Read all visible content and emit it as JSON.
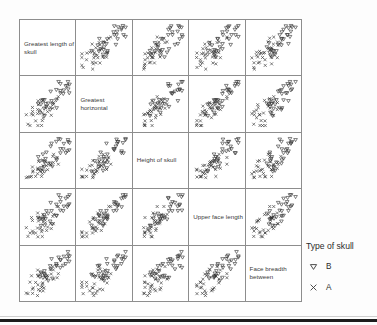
{
  "figure": {
    "title": "",
    "kind": "scatterplot-matrix"
  },
  "legend": {
    "title": "Type of skull",
    "entries": [
      {
        "label": "B",
        "marker": "triangle-down-icon",
        "color": "#2b2b2b"
      },
      {
        "label": "A",
        "marker": "cross-x-icon",
        "color": "#2b2b2b"
      }
    ]
  },
  "chart_data": {
    "type": "scatter",
    "layout": "matrix",
    "matrix_size": 5,
    "title": "",
    "xlabel": "",
    "ylabel": "",
    "grid": false,
    "axis_ticks": false,
    "legend_position": "right",
    "legend_title": "Type of skull",
    "variables": [
      "Greatest length of skull",
      "Greatest horizontal",
      "Height of skull",
      "Upper face length",
      "Face breadth between"
    ],
    "diagonal_labels": [
      "Greatest length of\nskull",
      "Greatest horizontal",
      "Height of skull",
      "Upper face length",
      "Face breadth\nbetween"
    ],
    "series": [
      {
        "name": "B",
        "marker": "triangle-down",
        "color": "#2b2b2b",
        "count": 30
      },
      {
        "name": "A",
        "marker": "cross",
        "color": "#2b2b2b",
        "count": 30
      }
    ],
    "xlim": [
      0,
      1
    ],
    "ylim": [
      0,
      1
    ],
    "points": {
      "B": [
        [
          0.62,
          0.82
        ],
        [
          0.7,
          0.78
        ],
        [
          0.58,
          0.9
        ],
        [
          0.66,
          0.7
        ],
        [
          0.74,
          0.64
        ],
        [
          0.54,
          0.74
        ],
        [
          0.6,
          0.62
        ],
        [
          0.68,
          0.86
        ],
        [
          0.5,
          0.66
        ],
        [
          0.72,
          0.72
        ],
        [
          0.64,
          0.58
        ],
        [
          0.56,
          0.56
        ],
        [
          0.78,
          0.8
        ],
        [
          0.46,
          0.6
        ],
        [
          0.66,
          0.5
        ],
        [
          0.6,
          0.46
        ],
        [
          0.74,
          0.88
        ],
        [
          0.52,
          0.84
        ],
        [
          0.7,
          0.54
        ],
        [
          0.58,
          0.68
        ],
        [
          0.82,
          0.74
        ],
        [
          0.48,
          0.78
        ],
        [
          0.64,
          0.92
        ],
        [
          0.76,
          0.58
        ],
        [
          0.54,
          0.5
        ],
        [
          0.68,
          0.66
        ],
        [
          0.44,
          0.7
        ],
        [
          0.8,
          0.66
        ],
        [
          0.62,
          0.36
        ],
        [
          0.72,
          0.44
        ]
      ],
      "A": [
        [
          0.3,
          0.34
        ],
        [
          0.38,
          0.42
        ],
        [
          0.26,
          0.28
        ],
        [
          0.42,
          0.38
        ],
        [
          0.34,
          0.46
        ],
        [
          0.22,
          0.36
        ],
        [
          0.46,
          0.32
        ],
        [
          0.36,
          0.24
        ],
        [
          0.28,
          0.44
        ],
        [
          0.44,
          0.5
        ],
        [
          0.32,
          0.52
        ],
        [
          0.18,
          0.3
        ],
        [
          0.4,
          0.26
        ],
        [
          0.5,
          0.44
        ],
        [
          0.24,
          0.5
        ],
        [
          0.36,
          0.56
        ],
        [
          0.14,
          0.4
        ],
        [
          0.48,
          0.22
        ],
        [
          0.3,
          0.2
        ],
        [
          0.42,
          0.6
        ],
        [
          0.2,
          0.24
        ],
        [
          0.52,
          0.36
        ],
        [
          0.34,
          0.64
        ],
        [
          0.26,
          0.58
        ],
        [
          0.44,
          0.16
        ],
        [
          0.38,
          0.34
        ],
        [
          0.1,
          0.34
        ],
        [
          0.56,
          0.5
        ],
        [
          0.32,
          0.12
        ],
        [
          0.22,
          0.62
        ]
      ]
    },
    "correlations": [
      [
        null,
        0.55,
        0.5,
        0.72,
        0.68
      ],
      [
        0.55,
        null,
        0.48,
        0.58,
        0.7
      ],
      [
        0.5,
        0.48,
        null,
        0.52,
        0.54
      ],
      [
        0.72,
        0.58,
        0.52,
        null,
        0.78
      ],
      [
        0.68,
        0.7,
        0.54,
        0.78,
        null
      ]
    ]
  }
}
